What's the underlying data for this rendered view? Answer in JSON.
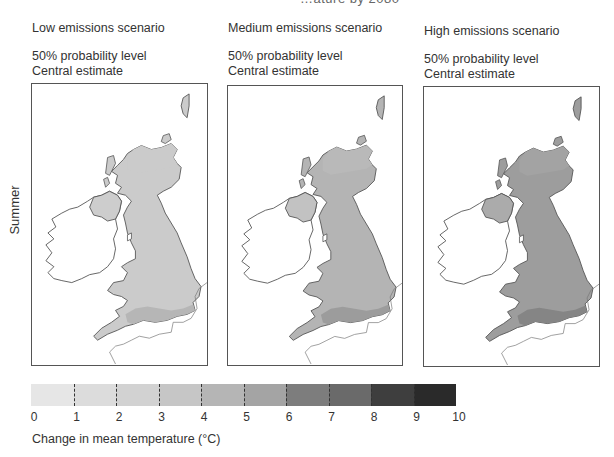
{
  "figure": {
    "title_partial": "…ature by 2080",
    "season_label": "Summer"
  },
  "panels": [
    {
      "scenario": "Low emissions scenario",
      "probability": "50% probability level",
      "estimate": "Central estimate",
      "fill_main": "#cbcbcb",
      "fill_ni": "#cdcdcd",
      "fill_south": "#b6b6b6",
      "fill_scot": "#cbcbcb"
    },
    {
      "scenario": "Medium emissions scenario",
      "probability": "50% probability level",
      "estimate": "Central estimate",
      "fill_main": "#b4b4b4",
      "fill_ni": "#c2c2c2",
      "fill_south": "#9c9c9c",
      "fill_scot": "#b9b9b9"
    },
    {
      "scenario": "High emissions scenario",
      "probability": "50% probability level",
      "estimate": "Central estimate",
      "fill_main": "#9d9d9d",
      "fill_ni": "#ababab",
      "fill_south": "#858585",
      "fill_scot": "#a3a3a3"
    }
  ],
  "legend": {
    "title": "Change in mean temperature (°C)",
    "ticks": [
      "0",
      "1",
      "2",
      "3",
      "4",
      "5",
      "6",
      "7",
      "8",
      "9",
      "10"
    ],
    "colors": [
      "#e6e6e6",
      "#dcdcdc",
      "#d2d2d2",
      "#c6c6c6",
      "#b5b5b5",
      "#a4a4a4",
      "#7d7d7d",
      "#6a6a6a",
      "#3e3e3e",
      "#2a2a2a"
    ]
  },
  "chart_data": {
    "type": "heatmap",
    "row_label": "Summer",
    "panels": [
      {
        "name": "Low emissions scenario",
        "probability": "50% probability level",
        "estimate": "Central estimate",
        "typical_range_c": [
          2,
          3
        ],
        "south_england_range_c": [
          3,
          4
        ]
      },
      {
        "name": "Medium emissions scenario",
        "probability": "50% probability level",
        "estimate": "Central estimate",
        "typical_range_c": [
          3,
          4
        ],
        "south_england_range_c": [
          4,
          5
        ]
      },
      {
        "name": "High emissions scenario",
        "probability": "50% probability level",
        "estimate": "Central estimate",
        "typical_range_c": [
          4,
          5
        ],
        "south_england_range_c": [
          5,
          6
        ]
      }
    ],
    "colorbar": {
      "label": "Change in mean temperature (°C)",
      "min": 0,
      "max": 10,
      "step": 1,
      "ticks": [
        0,
        1,
        2,
        3,
        4,
        5,
        6,
        7,
        8,
        9,
        10
      ]
    }
  }
}
